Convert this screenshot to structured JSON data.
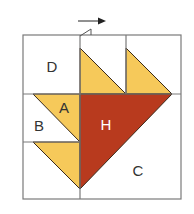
{
  "diagram": {
    "type": "quilt-block-piecing-diagram",
    "colors": {
      "background": "#ffffff",
      "grid_line": "#7a7a7a",
      "seam_line": "#3a2a1a",
      "light_fabric": "#f6c95a",
      "dark_fabric": "#b83a1e",
      "label_dark": "#333333",
      "label_light": "#ffffff",
      "arrow": "#222222"
    },
    "labels": {
      "D": "D",
      "A": "A",
      "B": "B",
      "H": "H",
      "C": "C"
    },
    "annotations": {
      "press_direction_arrow": "right"
    }
  }
}
